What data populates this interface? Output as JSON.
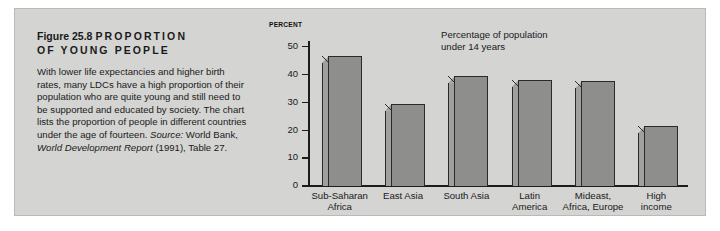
{
  "figure": {
    "number_label": "Figure 25.8",
    "title_line1": "PROPORTION",
    "title_line2": "OF YOUNG PEOPLE",
    "body_text": "With lower life expectancies and higher birth rates, many LDCs have a high proportion of their population who are quite young and still need to be supported and educated by society. The chart lists the proportion of people in different countries under the age of fourteen. ",
    "source_prefix": "Source:",
    "source_text_1": " World Bank, ",
    "source_italic": "World Development Report",
    "source_text_2": " (1991), Table 27."
  },
  "chart_data": {
    "type": "bar",
    "title": "",
    "annotation": "Percentage of population\nunder 14 years",
    "axis_unit_label": "PERCENT",
    "categories": [
      "Sub-Saharan\nAfrica",
      "East Asia",
      "South Asia",
      "Latin\nAmerica",
      "Mideast,\nAfrica, Europe",
      "High\nincome"
    ],
    "values": [
      46.5,
      29.5,
      39.5,
      38.0,
      37.5,
      21.5
    ],
    "xlabel": "",
    "ylabel": "PERCENT",
    "ylim": [
      0,
      52
    ],
    "yticks": [
      0,
      10,
      20,
      30,
      40,
      50
    ],
    "ytick_labels": [
      "0",
      "10",
      "20",
      "30",
      "40",
      "50"
    ],
    "grid": false,
    "legend": false,
    "bar_face_color": "#8e8e8c",
    "bar_side_color": "#a0a09e",
    "bar_outline_color": "#2a2a2a",
    "panel_background": "#d4d4d2"
  }
}
